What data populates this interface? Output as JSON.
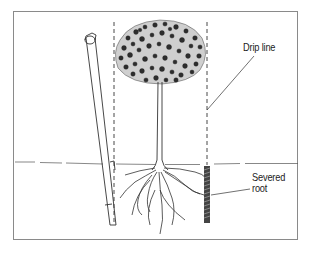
{
  "figure": {
    "labels": {
      "drip_line": "Drip line",
      "severed_root_line1": "Severed",
      "severed_root_line2": "root"
    },
    "colors": {
      "ink": "#333333",
      "frame": "#8a8a8a",
      "background": "#ffffff"
    }
  }
}
